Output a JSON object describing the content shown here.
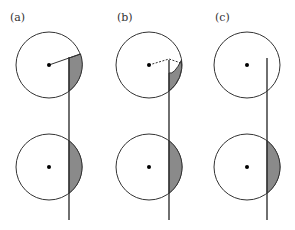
{
  "figure": {
    "panels": [
      {
        "label": "(a)",
        "top": {
          "cx": 49,
          "cy": 65,
          "r": 33,
          "line_x": 69,
          "line_top": 57,
          "radius_style": "solid"
        },
        "bottom": {
          "cx": 49,
          "cy": 167,
          "r": 33
        }
      },
      {
        "label": "(b)",
        "top": {
          "cx": 149,
          "cy": 65,
          "r": 33,
          "line_x": 169,
          "line_top": 60,
          "radius_style": "dashed"
        },
        "bottom": {
          "cx": 149,
          "cy": 167,
          "r": 33
        }
      },
      {
        "label": "(c)",
        "top": {
          "cx": 247,
          "cy": 65,
          "r": 33,
          "line_x": 267,
          "line_top": 58,
          "radius_style": "none"
        },
        "bottom": {
          "cx": 247,
          "cy": 167,
          "r": 33
        }
      }
    ],
    "line_bottom": 220,
    "colors": {
      "stroke": "#333333",
      "shade": "#8a8a8a",
      "background": "#ffffff"
    }
  }
}
